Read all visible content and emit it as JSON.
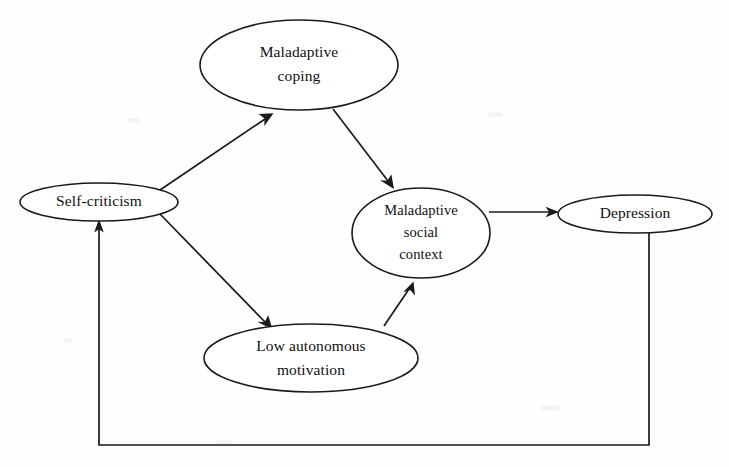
{
  "diagram": {
    "type": "path-model",
    "title": "",
    "background_color": "#fefefe",
    "stroke_color": "#1a1a1a",
    "text_color": "#101010",
    "nodes": [
      {
        "id": "maladaptive-coping",
        "label": "Maladaptive coping",
        "lines": [
          "Maladaptive",
          "coping"
        ],
        "shape": "ellipse",
        "cx": 299,
        "cy": 65,
        "rx": 99,
        "ry": 45
      },
      {
        "id": "self-criticism",
        "label": "Self-criticism",
        "lines": [
          "Self-criticism"
        ],
        "shape": "ellipse",
        "cx": 99,
        "cy": 202,
        "rx": 79,
        "ry": 19
      },
      {
        "id": "maladaptive-social-context",
        "label": "Maladaptive social context",
        "lines": [
          "Maladaptive",
          "social",
          "context"
        ],
        "shape": "ellipse",
        "cx": 421,
        "cy": 233,
        "rx": 69,
        "ry": 45
      },
      {
        "id": "depression",
        "label": "Depression",
        "lines": [
          "Depression"
        ],
        "shape": "ellipse",
        "cx": 635,
        "cy": 214,
        "rx": 77,
        "ry": 19
      },
      {
        "id": "low-autonomous-motivation",
        "label": "Low autonomous motivation",
        "lines": [
          "Low autonomous",
          "motivation"
        ],
        "shape": "ellipse",
        "cx": 311,
        "cy": 358,
        "rx": 107,
        "ry": 34
      }
    ],
    "edges": [
      {
        "id": "self-criticism-to-maladaptive-coping",
        "from": "self-criticism",
        "to": "maladaptive-coping",
        "style": "straight",
        "arrow": "to"
      },
      {
        "id": "maladaptive-coping-to-maladaptive-social-context",
        "from": "maladaptive-coping",
        "to": "maladaptive-social-context",
        "style": "straight",
        "arrow": "to"
      },
      {
        "id": "self-criticism-to-low-autonomous-motivation",
        "from": "self-criticism",
        "to": "low-autonomous-motivation",
        "style": "straight",
        "arrow": "to"
      },
      {
        "id": "low-autonomous-motivation-to-maladaptive-social-context",
        "from": "low-autonomous-motivation",
        "to": "maladaptive-social-context",
        "style": "straight",
        "arrow": "to"
      },
      {
        "id": "maladaptive-social-context-to-depression",
        "from": "maladaptive-social-context",
        "to": "depression",
        "style": "straight",
        "arrow": "to"
      },
      {
        "id": "depression-to-self-criticism-feedback",
        "from": "depression",
        "to": "self-criticism",
        "style": "orthogonal-feedback",
        "arrow": "to"
      }
    ]
  }
}
